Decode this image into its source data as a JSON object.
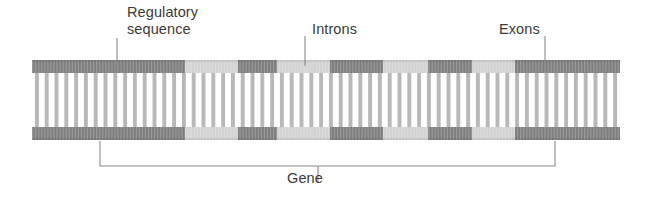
{
  "figure": {
    "type": "biology-diagram",
    "background_color": "#ffffff"
  },
  "labels": {
    "regulatory_sequence": "Regulatory\nsequence",
    "introns": "Introns",
    "exons": "Exons",
    "gene": "Gene"
  },
  "colors": {
    "exon_dark": "#7d7d7d",
    "intron_light": "#d2d2d2",
    "rung": "#b4b4b4",
    "text": "#3b3b3b",
    "leader_line": "#8a8a8a",
    "bracket": "#8a8a8a"
  },
  "dna": {
    "left": 32,
    "right": 620,
    "top_bar_y": 60,
    "bottom_bar_y": 127,
    "bar_height": 13,
    "rung_count": 60,
    "segments": [
      {
        "start": 32,
        "end": 185,
        "kind": "dark",
        "role": "regulatory-sequence-and-first-exon"
      },
      {
        "start": 185,
        "end": 238,
        "kind": "light",
        "role": "intron"
      },
      {
        "start": 238,
        "end": 277,
        "kind": "dark",
        "role": "exon"
      },
      {
        "start": 277,
        "end": 330,
        "kind": "light",
        "role": "intron"
      },
      {
        "start": 330,
        "end": 383,
        "kind": "dark",
        "role": "exon"
      },
      {
        "start": 383,
        "end": 428,
        "kind": "light",
        "role": "intron"
      },
      {
        "start": 428,
        "end": 472,
        "kind": "dark",
        "role": "exon"
      },
      {
        "start": 472,
        "end": 515,
        "kind": "light",
        "role": "intron"
      },
      {
        "start": 515,
        "end": 620,
        "kind": "dark",
        "role": "exon"
      }
    ]
  },
  "leaders": {
    "regulatory_sequence": {
      "x": 117,
      "y_top": 38,
      "y_bottom": 66
    },
    "introns": {
      "x": 305,
      "y_top": 36,
      "y_bottom": 66
    },
    "exons": {
      "x": 545,
      "y_top": 36,
      "y_bottom": 66
    }
  },
  "gene_bracket": {
    "left_x": 100,
    "right_x": 555,
    "top_y": 141,
    "bottom_y": 166,
    "label_x": 318,
    "label_y": 171
  }
}
